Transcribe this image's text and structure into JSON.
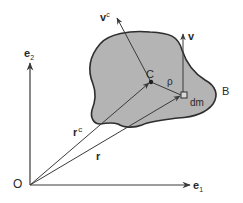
{
  "diagram": {
    "type": "rigid body kinematics",
    "colors": {
      "body_fill": "#b4b4b4",
      "body_stroke": "#2e2e2e",
      "line": "#3a3a3a",
      "text": "#2a2a2a",
      "background": "#ffffff"
    },
    "labels": {
      "origin": "O",
      "e1_base": "e",
      "e1_sub": "1",
      "e2_base": "e",
      "e2_sub": "2",
      "body": "B",
      "center": "C",
      "rho": "ρ",
      "dm": "dm",
      "v": "v",
      "vc_base": "v",
      "vc_sup": "c",
      "rc_base": "r",
      "rc_sup": "c",
      "r": "r"
    }
  }
}
